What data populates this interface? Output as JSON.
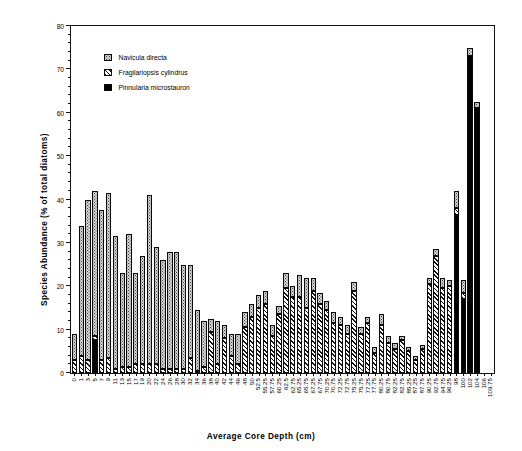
{
  "chart_data": {
    "type": "bar",
    "stacked": true,
    "title": "",
    "xlabel": "Average Core Depth (cm)",
    "ylabel": "Species Abundance (% of total diatoms)",
    "ylim": [
      0,
      80
    ],
    "ytick_major_step": 10,
    "ytick_minor_step": 2,
    "ytick_labels": [
      "0",
      "10",
      "20",
      "30",
      "40",
      "50",
      "60",
      "70",
      "80"
    ],
    "grid": false,
    "legend_position": "top-left",
    "categories": [
      "0",
      "1",
      "3",
      "5",
      "7",
      "9",
      "11",
      "13",
      "15",
      "17",
      "19",
      "20",
      "22",
      "24",
      "26",
      "28",
      "30",
      "32",
      "34",
      "36",
      "38",
      "40",
      "42",
      "44",
      "46",
      "48",
      "50",
      "52.5",
      "55.25",
      "57.75",
      "60.25",
      "62.5",
      "62.75",
      "65.25",
      "65.75",
      "67.25",
      "67.75",
      "70.25",
      "70.75",
      "72.25",
      "72.75",
      "75.25",
      "75.75",
      "77.25",
      "77.75",
      "80.25",
      "80.75",
      "82.25",
      "82.75",
      "85.25",
      "87.25",
      "87.75",
      "90.25",
      "92.75",
      "94.75",
      "96.25",
      "98",
      "100",
      "102",
      "104",
      "106",
      "109.75"
    ],
    "series": [
      {
        "name": "Navicula directa",
        "pattern": "stippled",
        "color": "#d8d8d8",
        "values": [
          6.0,
          30.0,
          37.0,
          33.5,
          34.5,
          38.0,
          30.5,
          21.5,
          30.5,
          21.0,
          25.0,
          39.0,
          27.0,
          25.0,
          27.0,
          27.0,
          24.0,
          21.5,
          14.0,
          10.5,
          3.0,
          10.0,
          3.0,
          5.0,
          7.0,
          3.5,
          3.0,
          3.0,
          3.0,
          2.5,
          2.0,
          3.5,
          2.5,
          5.0,
          7.0,
          3.0,
          2.5,
          2.0,
          2.5,
          2.0,
          2.0,
          2.0,
          1.5,
          1.5,
          1.5,
          2.5,
          1.5,
          1.5,
          1.0,
          1.0,
          1.0,
          1.0,
          1.5,
          1.5,
          2.5,
          1.5,
          4.0,
          3.0,
          2.0,
          1.5,
          0.0,
          0.0
        ]
      },
      {
        "name": "Fragilariopsis cylindrus",
        "pattern": "diagonal-hatch",
        "color": "#ffffff",
        "values": [
          3.0,
          4.0,
          3.0,
          1.0,
          3.0,
          3.5,
          1.0,
          1.5,
          1.5,
          2.0,
          2.0,
          2.0,
          2.0,
          1.0,
          1.0,
          1.0,
          1.0,
          3.5,
          0.5,
          1.5,
          9.5,
          2.0,
          8.0,
          4.0,
          2.0,
          10.5,
          13.0,
          15.0,
          16.0,
          8.5,
          13.5,
          19.5,
          17.5,
          17.5,
          15.0,
          19.0,
          16.0,
          14.5,
          11.5,
          11.0,
          9.0,
          19.0,
          9.0,
          11.5,
          4.5,
          11.0,
          7.0,
          5.5,
          7.5,
          5.0,
          3.0,
          5.5,
          20.5,
          27.0,
          19.5,
          20.0,
          1.5,
          1.5,
          0.0,
          0.0,
          0.0,
          0.0
        ]
      },
      {
        "name": "Pinnularia microstauron",
        "pattern": "solid",
        "color": "#000000",
        "values": [
          0.0,
          0.0,
          0.0,
          7.5,
          0.0,
          0.0,
          0.0,
          0.0,
          0.0,
          0.0,
          0.0,
          0.0,
          0.0,
          0.0,
          0.0,
          0.0,
          0.0,
          0.0,
          0.0,
          0.0,
          0.0,
          0.0,
          0.0,
          0.0,
          0.0,
          0.0,
          0.0,
          0.0,
          0.0,
          0.0,
          0.0,
          0.0,
          0.0,
          0.0,
          0.0,
          0.0,
          0.0,
          0.0,
          0.0,
          0.0,
          0.0,
          0.0,
          0.0,
          0.0,
          0.0,
          0.0,
          0.0,
          0.0,
          0.0,
          0.0,
          0.0,
          0.0,
          0.0,
          0.0,
          0.0,
          0.0,
          36.5,
          17.0,
          73.0,
          61.0,
          0.0,
          0.0
        ]
      }
    ],
    "legend": [
      "Navicula directa",
      "Fragilariopsis cylindrus",
      "Pinnularia microstauron"
    ]
  }
}
